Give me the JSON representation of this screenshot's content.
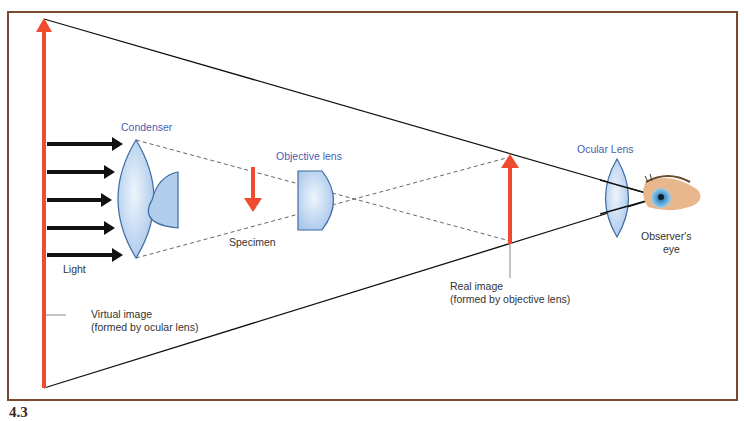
{
  "figure": {
    "caption_number": "4.3",
    "labels": {
      "condenser": "Condenser",
      "objective_lens": "Objective lens",
      "ocular_lens": "Ocular Lens",
      "specimen": "Specimen",
      "light": "Light",
      "virtual_image_1": "Virtual image",
      "virtual_image_2": "(formed by ocular lens)",
      "real_image_1": "Real image",
      "real_image_2": "(formed by objective lens)",
      "observer_1": "Observer's",
      "observer_2": "eye"
    },
    "colors": {
      "frame": "#7a4a2e",
      "arrow_red": "#f04a30",
      "lens_fill": "#b9d3ee",
      "lens_stroke": "#3e6aa0",
      "label_blue": "#4a5fb0"
    }
  }
}
